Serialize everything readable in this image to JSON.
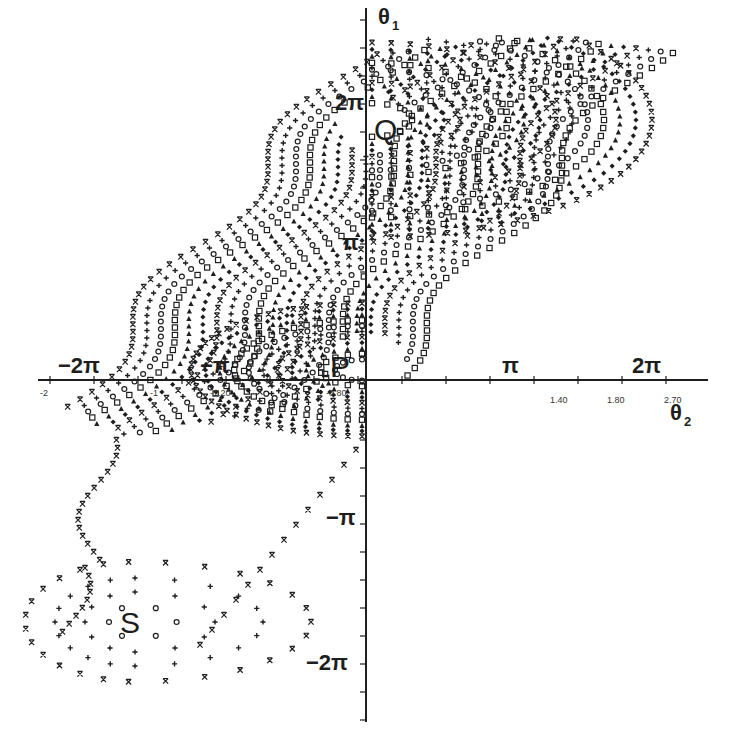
{
  "figure": {
    "type": "phase-portrait",
    "background": "#ffffff",
    "ink": "#1e1e1e"
  },
  "axes": {
    "x_label": "θ",
    "x_label_sub": "2",
    "y_label": "θ",
    "y_label_sub": "1",
    "x_pi_ticks": [
      "−2π",
      "−π",
      "π",
      "2π"
    ],
    "y_pi_ticks": [
      "2π",
      "π",
      "−π",
      "−2π"
    ],
    "x_numeric_ticks": [
      "-2",
      "-1",
      "-1.20",
      "-0.80",
      "1.40",
      "1.80",
      "2.70"
    ],
    "origin_px": [
      366,
      380
    ]
  },
  "points": {
    "P": "P",
    "Q": "Q",
    "S": "S"
  },
  "chart_data": {
    "type": "scatter",
    "title": "",
    "xlabel": "θ2",
    "ylabel": "θ1",
    "xlim": [
      "-2π",
      "2π"
    ],
    "ylim": [
      "-2π",
      "2π"
    ],
    "grid": false,
    "legend": "none",
    "fixed_points": [
      {
        "name": "P",
        "theta2": 0,
        "theta1": 0
      },
      {
        "name": "Q",
        "theta2": 0,
        "theta1": "2π"
      },
      {
        "name": "S",
        "theta2": "-2π",
        "theta1": "-2π"
      }
    ],
    "markers": [
      "x",
      "+",
      "o",
      "□",
      "△",
      "◆"
    ]
  }
}
